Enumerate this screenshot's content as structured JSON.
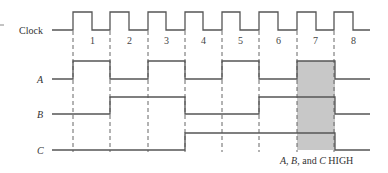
{
  "diagram": {
    "type": "timing-diagram",
    "signals": [
      {
        "name": "Clock",
        "italic": false
      },
      {
        "name": "A",
        "italic": true
      },
      {
        "name": "B",
        "italic": true
      },
      {
        "name": "C",
        "italic": true
      }
    ],
    "clock_pulse_numbers": [
      "1",
      "2",
      "3",
      "4",
      "5",
      "6",
      "7",
      "8"
    ],
    "waveforms": {
      "A": [
        1,
        0,
        1,
        0,
        1,
        0,
        1,
        0
      ],
      "B": [
        0,
        1,
        1,
        0,
        0,
        1,
        1,
        0
      ],
      "C": [
        0,
        0,
        0,
        1,
        1,
        1,
        1,
        0
      ]
    },
    "highlight": {
      "interval": 7,
      "caption_parts": [
        "A",
        ", ",
        "B",
        ", and ",
        "C",
        " HIGH"
      ],
      "fill": "#c8c8c8"
    }
  }
}
